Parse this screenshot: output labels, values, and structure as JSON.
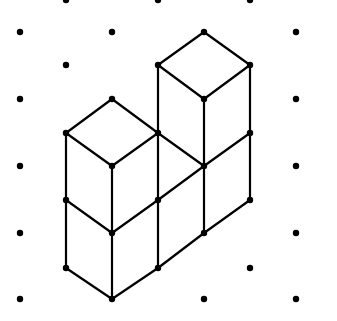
{
  "diagram": {
    "type": "isometric-dot-grid",
    "colors": {
      "background": "#ffffff",
      "line": "#000000",
      "dot": "#000000"
    },
    "grid_columns_x": [
      20,
      66,
      112,
      158,
      204,
      250,
      296
    ],
    "grid_dots": [
      [
        20,
        32
      ],
      [
        20,
        99
      ],
      [
        20,
        166
      ],
      [
        20,
        233
      ],
      [
        20,
        299
      ],
      [
        66,
        0
      ],
      [
        66,
        65
      ],
      [
        112,
        32
      ],
      [
        158,
        0
      ],
      [
        250,
        0
      ],
      [
        296,
        32
      ],
      [
        296,
        99
      ],
      [
        296,
        166
      ],
      [
        296,
        233
      ],
      [
        296,
        299
      ],
      [
        204,
        299
      ],
      [
        250,
        268
      ]
    ],
    "vertices": [
      [
        66,
        133
      ],
      [
        66,
        200
      ],
      [
        66,
        268
      ],
      [
        112,
        99
      ],
      [
        112,
        166
      ],
      [
        112,
        233
      ],
      [
        112,
        299
      ],
      [
        158,
        65
      ],
      [
        158,
        133
      ],
      [
        158,
        200
      ],
      [
        158,
        268
      ],
      [
        204,
        32
      ],
      [
        204,
        99
      ],
      [
        204,
        166
      ],
      [
        204,
        233
      ],
      [
        250,
        65
      ],
      [
        250,
        133
      ],
      [
        250,
        200
      ]
    ],
    "edges": [
      [
        66,
        133,
        112,
        99
      ],
      [
        112,
        99,
        158,
        133
      ],
      [
        66,
        133,
        112,
        166
      ],
      [
        112,
        166,
        158,
        133
      ],
      [
        66,
        133,
        66,
        268
      ],
      [
        112,
        166,
        112,
        299
      ],
      [
        158,
        65,
        158,
        268
      ],
      [
        66,
        200,
        112,
        233
      ],
      [
        112,
        233,
        158,
        200
      ],
      [
        158,
        200,
        204,
        166
      ],
      [
        204,
        166,
        250,
        133
      ],
      [
        66,
        268,
        112,
        299
      ],
      [
        112,
        299,
        158,
        268
      ],
      [
        158,
        268,
        204,
        233
      ],
      [
        204,
        233,
        250,
        200
      ],
      [
        158,
        65,
        204,
        32
      ],
      [
        204,
        32,
        250,
        65
      ],
      [
        158,
        65,
        204,
        99
      ],
      [
        204,
        99,
        250,
        65
      ],
      [
        204,
        99,
        204,
        233
      ],
      [
        250,
        65,
        250,
        200
      ],
      [
        158,
        133,
        204,
        166
      ]
    ],
    "cube_count": 6
  }
}
